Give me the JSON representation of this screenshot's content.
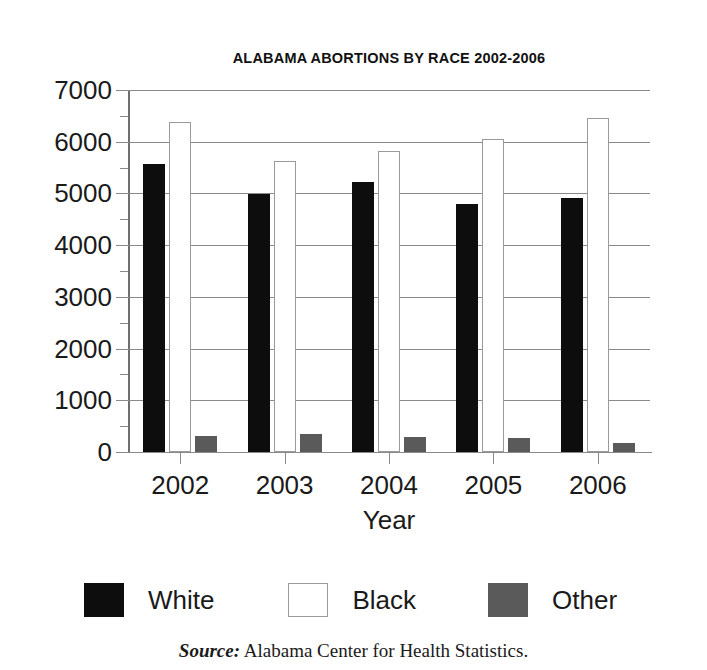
{
  "chart_data": {
    "type": "bar",
    "title": "ALABAMA ABORTIONS BY RACE 2002-2006",
    "xlabel": "Year",
    "ylabel": "",
    "categories": [
      "2002",
      "2003",
      "2004",
      "2005",
      "2006"
    ],
    "series": [
      {
        "name": "White",
        "color": "#0d0d0d",
        "values": [
          5575,
          4995,
          5225,
          4790,
          4920
        ]
      },
      {
        "name": "Black",
        "color": "#ffffff",
        "values": [
          6390,
          5630,
          5825,
          6060,
          6465
        ]
      },
      {
        "name": "Other",
        "color": "#5a5a5a",
        "values": [
          310,
          350,
          290,
          270,
          175
        ]
      }
    ],
    "ylim": [
      0,
      7000
    ],
    "ytick_labels": [
      "7000",
      "6000",
      "5000",
      "4000",
      "3000",
      "2000",
      "1000",
      "0"
    ],
    "ytick_values": [
      7000,
      6000,
      5000,
      4000,
      3000,
      2000,
      1000,
      0
    ],
    "ytick_step": 1000,
    "grid": true,
    "legend_position": "bottom"
  },
  "legend": {
    "items": [
      {
        "label": "White",
        "swatch": "black-filled-square"
      },
      {
        "label": "Black",
        "swatch": "white-open-square"
      },
      {
        "label": "Other",
        "swatch": "gray-filled-square"
      }
    ]
  },
  "source": {
    "prefix": "Source:",
    "text": " Alabama Center for Health Statistics."
  }
}
